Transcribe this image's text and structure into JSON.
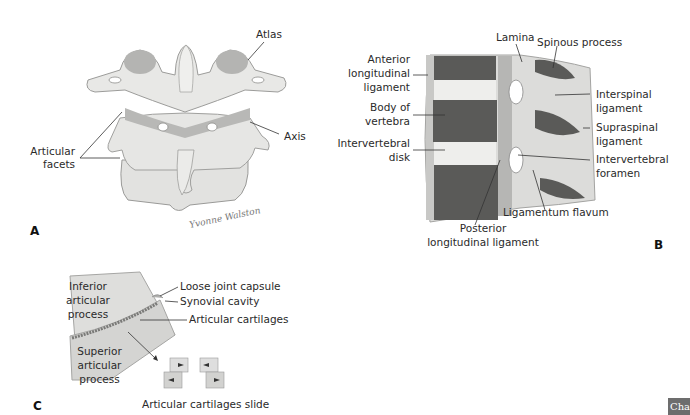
{
  "panels": {
    "A": {
      "letter": "A",
      "labels": {
        "atlas": "Atlas",
        "axis": "Axis",
        "articular_facets": [
          "Articular",
          "facets"
        ],
        "signature": "Yvonne Walston"
      }
    },
    "B": {
      "letter": "B",
      "labels": {
        "lamina": "Lamina",
        "spinous_process": "Spinous process",
        "anterior_longitudinal_ligament": [
          "Anterior",
          "longitudinal",
          "ligament"
        ],
        "body_of_vertebra": [
          "Body of",
          "vertebra"
        ],
        "intervertebral_disk": [
          "Intervertebral",
          "disk"
        ],
        "interspinal_ligament": [
          "Interspinal",
          "ligament"
        ],
        "supraspinal_ligament": [
          "Supraspinal",
          "ligament"
        ],
        "intervertebral_foramen": [
          "Intervertebral",
          "foramen"
        ],
        "ligamentum_flavum": "Ligamentum flavum",
        "posterior_longitudinal_ligament": [
          "Posterior",
          "longitudinal ligament"
        ]
      }
    },
    "C": {
      "letter": "C",
      "labels": {
        "inferior_articular_process": [
          "Inferior",
          "articular",
          "process"
        ],
        "loose_joint_capsule": "Loose joint capsule",
        "synovial_cavity": "Synovial cavity",
        "articular_cartilages": "Articular cartilages",
        "superior_articular_process": [
          "Superior",
          "articular",
          "process"
        ],
        "caption": "Articular cartilages slide"
      }
    }
  },
  "corner_tab": "Cha",
  "colors": {
    "bone_light": "#e4e4e2",
    "bone_shade": "#bdbdbb",
    "bone_dark": "#9a9a98",
    "spongy_bone": "#5a5a58",
    "line": "#333333"
  }
}
